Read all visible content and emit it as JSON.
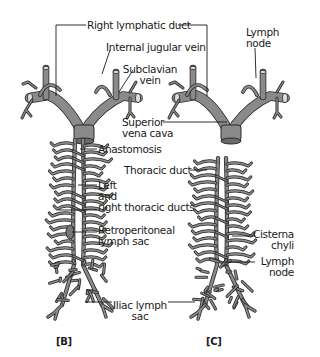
{
  "labels": {
    "right_lymphatic_duct": "Right lymphatic duct",
    "internal_jugular_vein": "Internal jugular vein",
    "subclavian_vein": [
      "Subclavian",
      "vein"
    ],
    "lymph_node_top": [
      "Lymph",
      "node"
    ],
    "superior_vena_cava": [
      "Superior",
      "vena cava"
    ],
    "anastomosis": "Anastomosis",
    "thoracic_duct": "Thoracic duct",
    "left_right_thoracic_ducts": [
      "Left",
      "and",
      "right thoracic ducts"
    ],
    "retroperitoneal_lymph_sac": [
      "Retroperitoneal",
      "lymph sac"
    ],
    "cisterna_chyli": [
      "Cisterna",
      "chyli"
    ],
    "lymph_node_bottom": [
      "Lymph",
      "node"
    ],
    "iliac_lymph_sac": [
      "Iliac lymph",
      "sac"
    ]
  },
  "panels": {
    "b": "[B]",
    "c": "[C]"
  },
  "colors": {
    "vessel_fill": "#8a8a8a",
    "outline": "#2b2b2b",
    "leader": "#1a1a1a"
  }
}
